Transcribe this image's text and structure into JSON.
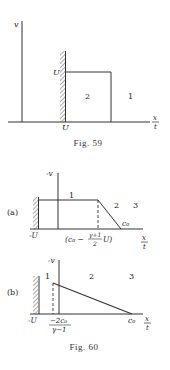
{
  "fig59": {
    "caption": "Fig. 59",
    "y_axis_label": "v",
    "x_axis_label_num": "x",
    "x_axis_label_den": "t",
    "wall_label_top": "U",
    "wall_label_bottom": "U",
    "region_2": "2",
    "region_1": "1"
  },
  "fig60": {
    "caption": "Fig. 60",
    "a": {
      "panel_label": "(a)",
      "y_axis_label": "-v",
      "x_axis_label_num": "x",
      "x_axis_label_den": "t",
      "wall_label": "-U",
      "region_1": "1",
      "region_2": "2",
      "region_3": "3",
      "c0_label": "c₀",
      "tick_label_open": "(c₀ −",
      "tick_label_frac_num": "γ+1",
      "tick_label_frac_den": "2",
      "tick_label_close": "U)"
    },
    "b": {
      "panel_label": "(b)",
      "y_axis_label": "-v",
      "x_axis_label_num": "x",
      "x_axis_label_den": "t",
      "wall_label": "-U",
      "region_1": "1",
      "region_2": "2",
      "region_3": "3",
      "c0_label": "c₀",
      "tick_frac_num": "−2c₀",
      "tick_frac_den": "γ−1"
    }
  }
}
